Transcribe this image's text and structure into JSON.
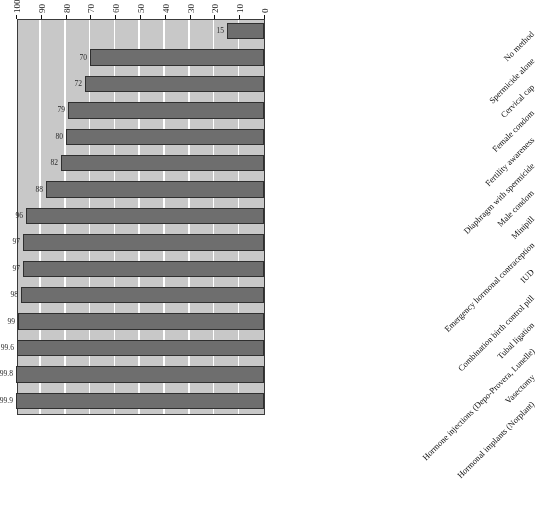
{
  "chart_data": {
    "type": "bar",
    "orientation": "horizontal",
    "title": "",
    "subtitle": "",
    "xlabel": "",
    "ylabel": "",
    "xlim": [
      0,
      100
    ],
    "x_axis_reversed": true,
    "grid": true,
    "legend": false,
    "rotated_180": true,
    "axis_ticks": [
      "100",
      "90",
      "80",
      "70",
      "60",
      "50",
      "40",
      "30",
      "20",
      "10",
      "0"
    ],
    "categories": [
      "Hormonal implants (Norplant)",
      "Vasectomy",
      "Hormone injections (Depo-Provera, Lunelle)",
      "Tubal ligation",
      "Combination birth control pill",
      "IUD",
      "Emergency hormonal contraception",
      "Minipill",
      "Male condom",
      "Diaphragm with spermicide",
      "Fertility awareness",
      "Female condom",
      "Cervical cap",
      "Spermicide alone",
      "No method"
    ],
    "values": [
      99.9,
      99.8,
      99.6,
      99,
      98,
      97,
      97,
      96,
      88,
      82,
      80,
      79,
      72,
      70,
      15
    ],
    "value_labels": [
      "99.9",
      "99.8",
      "99.6",
      "99",
      "98",
      "97",
      "97",
      "96",
      "88",
      "82",
      "80",
      "79",
      "72",
      "70",
      "15"
    ],
    "colors": {
      "bar_fill": "#6e6e6e",
      "bar_border": "#2f2f2f",
      "plot_background": "#c8c8c8",
      "gridline": "#ffffff",
      "axis": "#3a3a3a",
      "text": "#111111",
      "page_background": "#ffffff"
    }
  }
}
